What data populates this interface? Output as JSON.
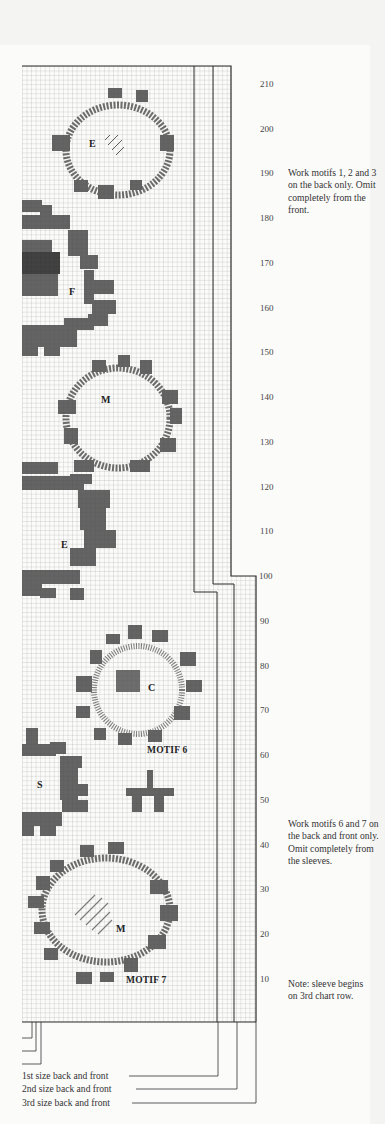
{
  "chart": {
    "type": "knitting-chart",
    "row_labels": [
      "210",
      "200",
      "190",
      "180",
      "170",
      "160",
      "150",
      "140",
      "130",
      "120",
      "110",
      "100",
      "90",
      "80",
      "70",
      "60",
      "50",
      "40",
      "30",
      "20",
      "10"
    ],
    "colors": {
      "ink": "#2b2b2b",
      "grid": "#9a9a9a",
      "paper": "#fbfbfa"
    }
  },
  "motifs": {
    "letters": [
      {
        "letter": "E",
        "motif": "upper wreath"
      },
      {
        "letter": "F",
        "motif": "left edge"
      },
      {
        "letter": "M",
        "motif": "middle wreath"
      },
      {
        "letter": "E",
        "motif": "left edge lower"
      },
      {
        "letter": "C",
        "motif": "motif 6 wreath"
      },
      {
        "letter": "S",
        "motif": "left edge bottom"
      },
      {
        "letter": "M",
        "motif": "motif 7 wreath"
      }
    ],
    "titles": {
      "motif6": "MOTIF 6",
      "motif7": "MOTIF 7"
    }
  },
  "notes": {
    "back_only": "Work motifs 1, 2 and 3 on the back only. Omit completely from the front.",
    "back_front": "Work motifs 6 and 7 on the back and front only. Omit completely from the sleeves.",
    "sleeve": "Note: sleeve begins on 3rd chart row."
  },
  "legend": {
    "size1": "1st size back and front",
    "size2": "2nd size back and front",
    "size3": "3rd size back and front"
  }
}
